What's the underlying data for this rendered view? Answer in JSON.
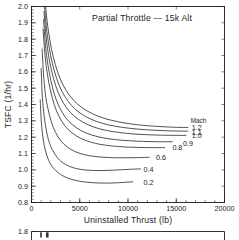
{
  "chart_data": {
    "type": "line",
    "title": "Partial Throttle  —  15k Alt",
    "xlabel": "Uninstalled Thrust  (lb)",
    "ylabel": "TSFC  (1/hr)",
    "xlim": [
      0,
      20000
    ],
    "ylim": [
      0.8,
      2.0
    ],
    "xticks": [
      0,
      5000,
      10000,
      15000,
      20000
    ],
    "xtick_labels": [
      "0",
      "5000",
      "10000",
      "15000",
      "20000"
    ],
    "xminor_step": 1000,
    "yticks": [
      0.8,
      0.9,
      1.0,
      1.1,
      1.2,
      1.3,
      1.4,
      1.5,
      1.6,
      1.7,
      1.8,
      1.9,
      2.0
    ],
    "ytick_labels": [
      "0.8",
      "0.9",
      "1.0",
      "1.1",
      "1.2",
      "1.3",
      "1.4",
      "1.5",
      "1.6",
      "1.7",
      "1.8",
      "1.9",
      "2.0"
    ],
    "yminor_step": 0.02,
    "grid": false,
    "legend_position": "inside-right",
    "legend_title": "Mach",
    "series": [
      {
        "name": "0.2",
        "label": "0.2",
        "label_x": 11600,
        "label_y": 0.925,
        "x": [
          900,
          1000,
          1100,
          1300,
          1600,
          2000,
          2500,
          3000,
          3600,
          4200,
          5000,
          5800,
          6600,
          7400,
          8200,
          9000,
          9800,
          10500
        ],
        "y": [
          1.43,
          1.31,
          1.24,
          1.155,
          1.085,
          1.032,
          0.996,
          0.972,
          0.953,
          0.941,
          0.93,
          0.924,
          0.92,
          0.919,
          0.919,
          0.921,
          0.924,
          0.927
        ]
      },
      {
        "name": "0.4",
        "label": "0.4",
        "label_x": 11600,
        "label_y": 1.005,
        "x": [
          1000,
          1100,
          1250,
          1450,
          1750,
          2150,
          2650,
          3200,
          3900,
          4700,
          5600,
          6500,
          7500,
          8500,
          9500,
          10500,
          11300
        ],
        "y": [
          1.62,
          1.47,
          1.36,
          1.27,
          1.186,
          1.124,
          1.077,
          1.045,
          1.022,
          1.007,
          0.999,
          0.996,
          0.996,
          0.998,
          1.001,
          1.004,
          1.006
        ]
      },
      {
        "name": "0.6",
        "label": "0.6",
        "label_x": 12900,
        "label_y": 1.078,
        "x": [
          1100,
          1250,
          1450,
          1700,
          2050,
          2500,
          3050,
          3700,
          4500,
          5400,
          6400,
          7500,
          8700,
          9900,
          11100,
          12200
        ],
        "y": [
          1.74,
          1.58,
          1.46,
          1.376,
          1.295,
          1.228,
          1.177,
          1.14,
          1.112,
          1.094,
          1.083,
          1.077,
          1.074,
          1.074,
          1.075,
          1.077
        ]
      },
      {
        "name": "0.8",
        "label": "0.8",
        "label_x": 14600,
        "label_y": 1.138,
        "x": [
          1200,
          1400,
          1650,
          1950,
          2350,
          2850,
          3450,
          4200,
          5100,
          6100,
          7200,
          8400,
          9700,
          11100,
          12500,
          13800
        ],
        "y": [
          1.86,
          1.7,
          1.585,
          1.49,
          1.4,
          1.328,
          1.27,
          1.226,
          1.193,
          1.17,
          1.155,
          1.146,
          1.14,
          1.137,
          1.136,
          1.136
        ]
      },
      {
        "name": "0.9",
        "label": "0.9",
        "label_x": 15700,
        "label_y": 1.162,
        "x": [
          1250,
          1450,
          1700,
          2000,
          2400,
          2900,
          3500,
          4250,
          5150,
          6200,
          7400,
          8700,
          10100,
          11600,
          13100,
          14600
        ],
        "y": [
          1.92,
          1.76,
          1.645,
          1.548,
          1.457,
          1.383,
          1.323,
          1.276,
          1.24,
          1.214,
          1.196,
          1.185,
          1.178,
          1.174,
          1.172,
          1.172
        ]
      },
      {
        "name": "1.0",
        "label": "1.0",
        "label_x": 16600,
        "label_y": 1.208,
        "x": [
          1300,
          1500,
          1760,
          2080,
          2500,
          3020,
          3650,
          4420,
          5350,
          6450,
          7700,
          9050,
          10500,
          12000,
          13600,
          15200,
          16000
        ],
        "y": [
          1.97,
          1.82,
          1.705,
          1.607,
          1.516,
          1.44,
          1.378,
          1.329,
          1.291,
          1.262,
          1.242,
          1.229,
          1.22,
          1.215,
          1.212,
          1.211,
          1.211
        ]
      },
      {
        "name": "1.1",
        "label": "1.1",
        "label_x": 16600,
        "label_y": 1.232,
        "x": [
          1350,
          1560,
          1830,
          2160,
          2600,
          3140,
          3800,
          4600,
          5560,
          6700,
          8000,
          9400,
          10900,
          12500,
          14100,
          15700,
          16200
        ],
        "y": [
          2.0,
          1.865,
          1.75,
          1.652,
          1.56,
          1.482,
          1.419,
          1.368,
          1.328,
          1.297,
          1.275,
          1.26,
          1.25,
          1.243,
          1.239,
          1.237,
          1.237
        ]
      },
      {
        "name": "1.2",
        "label": "1.2",
        "label_x": 16600,
        "label_y": 1.258,
        "x": [
          1400,
          1620,
          1900,
          2250,
          2700,
          3260,
          3950,
          4780,
          5780,
          6960,
          8300,
          9750,
          11300,
          12950,
          14600,
          16200
        ],
        "y": [
          2.04,
          1.91,
          1.793,
          1.693,
          1.6,
          1.52,
          1.455,
          1.402,
          1.36,
          1.327,
          1.303,
          1.286,
          1.274,
          1.266,
          1.261,
          1.259
        ]
      }
    ]
  },
  "second_chart": {
    "first_ytick_label": "1.8"
  },
  "style": {
    "curve_color": "#333333",
    "axis_color": "#1a1a1a",
    "background": "#ffffff"
  }
}
